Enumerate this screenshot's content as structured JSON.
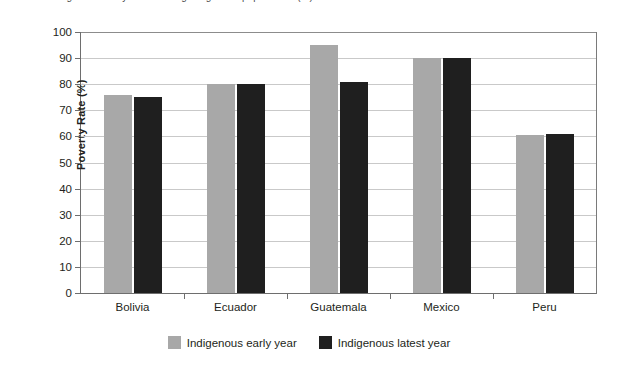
{
  "top_caption": {
    "text": "Figure: Poverty rates among indigenous populations (%)"
  },
  "chart_data": {
    "type": "bar",
    "title": "",
    "xlabel": "",
    "ylabel": "Poverty Rate (%)",
    "ylim": [
      0,
      100
    ],
    "ytick_labels": [
      "100",
      "90",
      "80",
      "70",
      "60",
      "50",
      "40",
      "30",
      "20",
      "10",
      "0"
    ],
    "ytick_values": [
      100,
      90,
      80,
      70,
      60,
      50,
      40,
      30,
      20,
      10,
      0
    ],
    "grid": true,
    "legend_position": "bottom",
    "categories": [
      "Bolivia",
      "Ecuador",
      "Guatemala",
      "Mexico",
      "Peru"
    ],
    "series": [
      {
        "name": "Indigenous early year",
        "color": "#a8a8a8",
        "values": [
          76,
          80,
          95,
          90,
          60.5
        ]
      },
      {
        "name": "Indigenous latest year",
        "color": "#1f1f1f",
        "values": [
          75,
          80,
          81,
          90,
          61
        ]
      }
    ]
  },
  "colors": {
    "early_year": "#a8a8a8",
    "latest_year": "#1f1f1f",
    "gridline": "#c9c9c9",
    "axis": "#6e6e6e",
    "text": "#231f20",
    "background": "#ffffff"
  }
}
